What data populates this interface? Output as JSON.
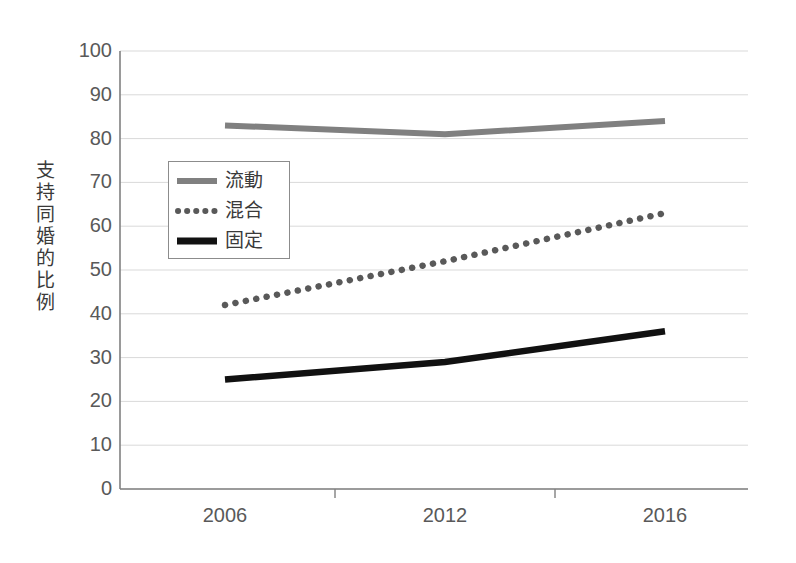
{
  "chart_data": {
    "type": "line",
    "title": "",
    "xlabel": "",
    "ylabel": "支持同婚的比例",
    "categories": [
      "2006",
      "2012",
      "2016"
    ],
    "ylim": [
      0,
      100
    ],
    "ytick_labels": [
      "0",
      "10",
      "20",
      "30",
      "40",
      "50",
      "60",
      "70",
      "80",
      "90",
      "100"
    ],
    "ytick_values": [
      0,
      10,
      20,
      30,
      40,
      50,
      60,
      70,
      80,
      90,
      100
    ],
    "grid": true,
    "legend_position": "inside-upper-left",
    "series": [
      {
        "name": "流動",
        "style": "solid",
        "color": "#808080",
        "values": [
          83,
          81,
          84
        ]
      },
      {
        "name": "混合",
        "style": "dotted",
        "color": "#595959",
        "values": [
          42,
          52,
          63
        ]
      },
      {
        "name": "固定",
        "style": "solid",
        "color": "#111111",
        "values": [
          25,
          29,
          36
        ]
      }
    ]
  },
  "axis": {
    "y_title": "支持同婚的比例"
  },
  "legend": {
    "entries": [
      {
        "label": "流動"
      },
      {
        "label": "混合"
      },
      {
        "label": "固定"
      }
    ]
  },
  "colors": {
    "grid": "#d9d9d9",
    "axis": "#808080",
    "tick_text": "#595959",
    "series_fluid": "#808080",
    "series_mixed": "#595959",
    "series_fixed": "#111111",
    "background": "#ffffff"
  }
}
